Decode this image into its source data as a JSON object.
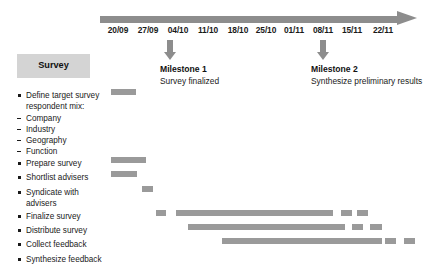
{
  "chart_data": {
    "type": "bar",
    "chart_kind": "gantt-timeline",
    "title": "Survey",
    "xlabel": "",
    "ylabel": "",
    "grid": false,
    "legend": "none",
    "axis": {
      "tick_labels": [
        "20/09",
        "27/09",
        "04/10",
        "11/10",
        "18/10",
        "25/10",
        "01/11",
        "08/11",
        "15/11",
        "22/11"
      ],
      "tick_x_px": [
        118,
        148,
        178,
        208,
        238,
        266,
        294,
        323,
        352,
        383
      ],
      "arrow_direction": "right"
    },
    "milestones": [
      {
        "id": "milestone-1",
        "title": "Milestone 1",
        "description": "Survey finalized",
        "at_tick": "04/10",
        "marker_x_px": 170,
        "label_x_px": 160,
        "label_y_px": 64
      },
      {
        "id": "milestone-2",
        "title": "Milestone 2",
        "description": "Synthesize preliminary results",
        "at_tick": "08/11",
        "marker_x_px": 323,
        "label_x_px": 311,
        "label_y_px": 64
      }
    ],
    "categories": [
      "Define target survey respondent mix:",
      "Company",
      "Industry",
      "Geography",
      "Function",
      "Prepare survey",
      "Shortlist advisers",
      "Syndicate with advisers",
      "Finalize survey",
      "Distribute survey",
      "Collect feedback",
      "Synthesize feedback"
    ],
    "tasks": [
      {
        "label": "Define target survey",
        "label_2": "respondent mix:",
        "marker": "bullet",
        "y_px": 90,
        "segments": [
          {
            "start_px": 111,
            "width_px": 25
          }
        ]
      },
      {
        "label": "Company",
        "marker": "dash",
        "y_px": 113,
        "segments": []
      },
      {
        "label": "Industry",
        "marker": "dash",
        "y_px": 124,
        "segments": []
      },
      {
        "label": "Geography",
        "marker": "dash",
        "y_px": 135,
        "segments": []
      },
      {
        "label": "Function",
        "marker": "dash",
        "y_px": 146,
        "segments": []
      },
      {
        "label": "Prepare survey",
        "marker": "bullet",
        "y_px": 158,
        "segments": [
          {
            "start_px": 111,
            "width_px": 35
          }
        ]
      },
      {
        "label": "Shortlist advisers",
        "marker": "bullet",
        "y_px": 172,
        "segments": [
          {
            "start_px": 111,
            "width_px": 26
          }
        ]
      },
      {
        "label": "Syndicate with",
        "label_2": "advisers",
        "marker": "bullet",
        "y_px": 187,
        "segments": [
          {
            "start_px": 142,
            "width_px": 11
          }
        ]
      },
      {
        "label": "Finalize survey",
        "marker": "bullet",
        "y_px": 211,
        "segments": [
          {
            "start_px": 156,
            "width_px": 10
          },
          {
            "start_px": 176,
            "width_px": 157
          },
          {
            "start_px": 341,
            "width_px": 11
          },
          {
            "start_px": 357,
            "width_px": 11
          }
        ]
      },
      {
        "label": "Distribute survey",
        "marker": "bullet",
        "y_px": 225,
        "segments": [
          {
            "start_px": 188,
            "width_px": 157
          },
          {
            "start_px": 352,
            "width_px": 11
          },
          {
            "start_px": 370,
            "width_px": 12
          }
        ]
      },
      {
        "label": "Collect feedback",
        "marker": "bullet",
        "y_px": 239,
        "segments": [
          {
            "start_px": 222,
            "width_px": 160
          },
          {
            "start_px": 385,
            "width_px": 11
          },
          {
            "start_px": 404,
            "width_px": 11
          }
        ]
      },
      {
        "label": "Synthesize feedback",
        "marker": "bullet",
        "y_px": 254,
        "segments": []
      }
    ],
    "colors": {
      "bar": "#9a9a9a",
      "axis": "#8d8d8d",
      "header_chip": "#d4d4d4",
      "text": "#1a1a1a",
      "background": "#ffffff"
    }
  },
  "header": {
    "survey_label": "Survey"
  }
}
